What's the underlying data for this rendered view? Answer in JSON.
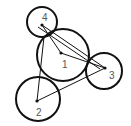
{
  "diagram": {
    "stroke_color": "#111111",
    "label_color": "#555555",
    "nodes": [
      {
        "id": "1",
        "label": "1",
        "cx": 63,
        "cy": 55,
        "r": 26,
        "px": 61,
        "py": 53,
        "lx": 62,
        "ly": 68
      },
      {
        "id": "2",
        "label": "2",
        "cx": 38,
        "cy": 99,
        "r": 22,
        "px": 37,
        "py": 101,
        "lx": 36,
        "ly": 116
      },
      {
        "id": "3",
        "label": "3",
        "cx": 104,
        "cy": 71,
        "r": 18,
        "px": 105,
        "py": 68,
        "lx": 109,
        "ly": 79
      },
      {
        "id": "4",
        "label": "4",
        "cx": 42,
        "cy": 22,
        "r": 15,
        "px": 42,
        "py": 25,
        "lx": 42,
        "ly": 21
      }
    ],
    "edges": [
      {
        "from": "4",
        "to": "1",
        "x1": 42,
        "y1": 25,
        "x2": 61,
        "y2": 53
      },
      {
        "from": "4",
        "to": "3",
        "x1": 42,
        "y1": 25,
        "x2": 105,
        "y2": 68
      },
      {
        "from": "4",
        "to": "3",
        "x1": 38,
        "y1": 27,
        "x2": 100,
        "y2": 69
      },
      {
        "from": "4",
        "to": "2",
        "x1": 44,
        "y1": 37,
        "x2": 37,
        "y2": 101
      },
      {
        "from": "1",
        "to": "3",
        "x1": 61,
        "y1": 53,
        "x2": 105,
        "y2": 68
      },
      {
        "from": "2",
        "to": "3",
        "x1": 37,
        "y1": 101,
        "x2": 105,
        "y2": 68
      }
    ]
  }
}
